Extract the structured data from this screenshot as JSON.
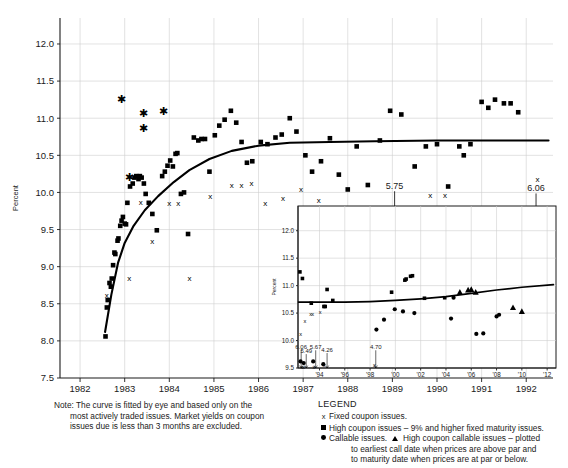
{
  "figure": {
    "note_label": "Note:",
    "note_lines": [
      "The curve is fitted by eye and based only on the",
      "most actively traded issues. Market yields on coupon",
      "issues due is less than 3 months are excluded."
    ],
    "legend_title": "LEGEND",
    "legend_items": [
      {
        "marker": "x",
        "text": "Fixed coupon issues."
      },
      {
        "marker": "square",
        "text": "High coupon issues – 9% and higher fixed maturity issues."
      },
      {
        "marker": "circle",
        "text": "Callable issues.",
        "marker2": "triangle",
        "text2": "High coupon callable issues – plotted"
      },
      {
        "marker": "none",
        "text": "to earliest call date when prices are above par and"
      },
      {
        "marker": "none",
        "text": "to maturity date when prices are at par or below."
      }
    ]
  },
  "chart_data": [
    {
      "id": "main",
      "type": "scatter",
      "title": "",
      "xlabel": "",
      "ylabel": "Percent",
      "xlim": [
        1981.55,
        1992.6
      ],
      "ylim": [
        7.5,
        12.35
      ],
      "yticks": [
        "7.5",
        "8.0",
        "8.5",
        "9.0",
        "9.5",
        "10.0",
        "10.5",
        "11.0",
        "11.5",
        "12.0"
      ],
      "ytick_values": [
        7.5,
        8.0,
        8.5,
        9.0,
        9.5,
        10.0,
        10.5,
        11.0,
        11.5,
        12.0
      ],
      "xticks": [
        "1982",
        "1983",
        "1984",
        "1985",
        "1986",
        "1987",
        "1988",
        "1989",
        "1990",
        "1991",
        "1992"
      ],
      "xtick_values": [
        1982,
        1983,
        1984,
        1985,
        1986,
        1987,
        1988,
        1989,
        1990,
        1991,
        1992
      ],
      "grid": true,
      "legend_position": "below-right",
      "series": [
        {
          "name": "High coupon issues",
          "marker": "square",
          "points": [
            [
              1982.57,
              8.06
            ],
            [
              1982.6,
              8.45
            ],
            [
              1982.62,
              8.55
            ],
            [
              1982.66,
              8.78
            ],
            [
              1982.69,
              8.73
            ],
            [
              1982.71,
              8.84
            ],
            [
              1982.74,
              9.02
            ],
            [
              1982.77,
              9.19
            ],
            [
              1982.79,
              9.17
            ],
            [
              1982.84,
              9.35
            ],
            [
              1982.86,
              9.38
            ],
            [
              1982.9,
              9.55
            ],
            [
              1982.93,
              9.62
            ],
            [
              1982.96,
              9.67
            ],
            [
              1983.0,
              9.58
            ],
            [
              1983.03,
              9.57
            ],
            [
              1983.06,
              9.86
            ],
            [
              1983.12,
              10.08
            ],
            [
              1983.18,
              10.12
            ],
            [
              1983.22,
              10.2
            ],
            [
              1983.26,
              10.22
            ],
            [
              1983.31,
              10.18
            ],
            [
              1983.34,
              10.22
            ],
            [
              1983.38,
              10.2
            ],
            [
              1983.43,
              10.12
            ],
            [
              1983.47,
              9.98
            ],
            [
              1983.54,
              9.86
            ],
            [
              1983.62,
              9.71
            ],
            [
              1983.72,
              9.49
            ],
            [
              1983.84,
              10.22
            ],
            [
              1983.9,
              10.28
            ],
            [
              1983.96,
              10.36
            ],
            [
              1984.02,
              10.43
            ],
            [
              1984.08,
              10.35
            ],
            [
              1984.14,
              10.52
            ],
            [
              1984.18,
              10.53
            ],
            [
              1984.26,
              9.98
            ],
            [
              1984.33,
              10.0
            ],
            [
              1984.42,
              9.44
            ],
            [
              1984.55,
              10.74
            ],
            [
              1984.65,
              10.7
            ],
            [
              1984.72,
              10.72
            ],
            [
              1984.8,
              10.72
            ],
            [
              1984.9,
              10.28
            ],
            [
              1985.02,
              10.77
            ],
            [
              1985.12,
              10.9
            ],
            [
              1985.24,
              10.98
            ],
            [
              1985.38,
              11.1
            ],
            [
              1985.5,
              10.94
            ],
            [
              1985.62,
              10.68
            ],
            [
              1985.74,
              10.4
            ],
            [
              1985.86,
              10.42
            ],
            [
              1986.05,
              10.68
            ],
            [
              1986.2,
              10.65
            ],
            [
              1986.38,
              10.74
            ],
            [
              1986.52,
              10.78
            ],
            [
              1986.7,
              11.0
            ],
            [
              1986.85,
              10.82
            ],
            [
              1987.05,
              10.5
            ],
            [
              1987.2,
              10.28
            ],
            [
              1987.4,
              10.42
            ],
            [
              1987.6,
              10.73
            ],
            [
              1987.8,
              10.24
            ],
            [
              1988.0,
              10.04
            ],
            [
              1988.2,
              10.62
            ],
            [
              1988.45,
              10.1
            ],
            [
              1988.72,
              10.7
            ],
            [
              1988.95,
              11.1
            ],
            [
              1989.2,
              11.05
            ],
            [
              1989.5,
              10.35
            ],
            [
              1989.75,
              10.62
            ],
            [
              1990.0,
              10.65
            ],
            [
              1990.25,
              10.08
            ],
            [
              1990.5,
              10.62
            ],
            [
              1990.6,
              10.5
            ],
            [
              1990.75,
              10.65
            ],
            [
              1991.0,
              11.22
            ],
            [
              1991.15,
              11.14
            ],
            [
              1991.3,
              11.25
            ],
            [
              1991.5,
              11.2
            ],
            [
              1991.65,
              11.2
            ],
            [
              1991.82,
              11.08
            ]
          ]
        },
        {
          "name": "Fixed coupon issues",
          "marker": "x",
          "points": [
            [
              1982.6,
              8.62
            ],
            [
              1983.1,
              8.84
            ],
            [
              1983.36,
              9.87
            ],
            [
              1983.62,
              9.35
            ],
            [
              1984.0,
              9.85
            ],
            [
              1984.2,
              9.85
            ],
            [
              1984.45,
              8.84
            ],
            [
              1984.92,
              9.95
            ],
            [
              1985.4,
              10.1
            ],
            [
              1985.62,
              10.1
            ],
            [
              1985.84,
              10.12
            ],
            [
              1986.15,
              9.86
            ],
            [
              1986.55,
              9.93
            ],
            [
              1986.95,
              10.05
            ],
            [
              1987.35,
              9.9
            ],
            [
              1989.85,
              9.96
            ],
            [
              1990.18,
              9.96
            ],
            [
              1992.25,
              10.18
            ]
          ]
        },
        {
          "name": "Starred outliers",
          "marker": "star",
          "points": [
            [
              1982.93,
              11.26
            ],
            [
              1983.42,
              11.07
            ],
            [
              1983.42,
              10.87
            ],
            [
              1983.88,
              11.1
            ],
            [
              1983.1,
              10.2
            ]
          ]
        }
      ],
      "fit_curve": [
        [
          1982.56,
          8.12
        ],
        [
          1982.7,
          8.62
        ],
        [
          1982.85,
          9.05
        ],
        [
          1983.0,
          9.32
        ],
        [
          1983.2,
          9.55
        ],
        [
          1983.45,
          9.76
        ],
        [
          1983.75,
          9.95
        ],
        [
          1984.1,
          10.14
        ],
        [
          1984.45,
          10.3
        ],
        [
          1984.9,
          10.45
        ],
        [
          1985.4,
          10.56
        ],
        [
          1986.0,
          10.63
        ],
        [
          1986.7,
          10.67
        ],
        [
          1987.6,
          10.68
        ],
        [
          1988.6,
          10.69
        ],
        [
          1990.0,
          10.7
        ],
        [
          1992.5,
          10.7
        ]
      ],
      "annotations": [
        {
          "text": "5.75",
          "x": 1989.05,
          "y": 10.05,
          "arrow_to": 9.74
        },
        {
          "text": "6.06",
          "x": 1992.22,
          "y": 10.02,
          "arrow_to": 9.74
        }
      ]
    },
    {
      "id": "inset",
      "type": "scatter",
      "title": "",
      "xlabel": "",
      "ylabel": "Percent",
      "xlim": [
        1992.3,
        2012.7
      ],
      "ylim": [
        9.5,
        12.45
      ],
      "yticks": [
        "9.5",
        "10.0",
        "10.5",
        "11.0",
        "11.5",
        "12.0"
      ],
      "ytick_values": [
        9.5,
        10.0,
        10.5,
        11.0,
        11.5,
        12.0
      ],
      "xticks": [
        "'94",
        "'96",
        "'98",
        "'00",
        "'02",
        "'04",
        "'06",
        "'08",
        "'10",
        "'12"
      ],
      "xtick_values": [
        1994,
        1996,
        1998,
        2000,
        2002,
        2004,
        2006,
        2008,
        2010,
        2012
      ],
      "grid": true,
      "series": [
        {
          "name": "High coupon issues",
          "marker": "square",
          "points": [
            [
              1992.45,
              11.25
            ],
            [
              1992.65,
              11.13
            ],
            [
              1994.6,
              10.93
            ],
            [
              1995.05,
              10.73
            ],
            [
              1994.35,
              10.62
            ],
            [
              1994.45,
              10.62
            ],
            [
              1993.35,
              10.68
            ],
            [
              1999.7,
              10.88
            ],
            [
              2000.75,
              11.1
            ],
            [
              2000.85,
              11.12
            ],
            [
              2001.2,
              11.17
            ],
            [
              2001.35,
              11.18
            ],
            [
              2002.3,
              10.77
            ],
            [
              2003.9,
              10.78
            ]
          ]
        },
        {
          "name": "Callable issues",
          "marker": "circle",
          "points": [
            [
              1992.5,
              9.62
            ],
            [
              1992.75,
              9.59
            ],
            [
              1993.5,
              9.62
            ],
            [
              1994.3,
              9.57
            ],
            [
              1998.5,
              10.2
            ],
            [
              1999.1,
              10.38
            ],
            [
              1999.95,
              10.57
            ],
            [
              2000.6,
              10.53
            ],
            [
              2001.5,
              10.5
            ],
            [
              2004.4,
              10.4
            ],
            [
              2004.6,
              10.78
            ],
            [
              2006.4,
              10.12
            ],
            [
              2006.95,
              10.13
            ],
            [
              2008.0,
              10.44
            ],
            [
              2008.2,
              10.47
            ]
          ]
        },
        {
          "name": "Fixed coupon issues",
          "marker": "x",
          "points": [
            [
              1992.5,
              10.12
            ],
            [
              1992.85,
              10.35
            ],
            [
              1993.3,
              10.48
            ],
            [
              1993.45,
              10.48
            ],
            [
              1994.05,
              10.52
            ],
            [
              1992.6,
              9.52
            ],
            [
              1992.75,
              9.52
            ],
            [
              1993.55,
              9.52
            ],
            [
              1994.35,
              9.55
            ],
            [
              1998.35,
              9.55
            ]
          ]
        },
        {
          "name": "High coupon callable issues",
          "marker": "triangle",
          "points": [
            [
              2005.1,
              10.88
            ],
            [
              2005.75,
              10.92
            ],
            [
              2006.0,
              10.93
            ],
            [
              2006.35,
              10.88
            ],
            [
              2009.3,
              10.6
            ],
            [
              2010.0,
              10.53
            ]
          ]
        }
      ],
      "fit_curve": [
        [
          1992.35,
          10.7
        ],
        [
          1994.0,
          10.7
        ],
        [
          1996.0,
          10.7
        ],
        [
          1998.0,
          10.71
        ],
        [
          2000.0,
          10.73
        ],
        [
          2002.0,
          10.76
        ],
        [
          2004.0,
          10.8
        ],
        [
          2006.0,
          10.86
        ],
        [
          2008.0,
          10.92
        ],
        [
          2010.0,
          10.97
        ],
        [
          2012.5,
          11.02
        ]
      ],
      "annotations": [
        {
          "text": "6.06",
          "x": 1992.55,
          "y": 9.85,
          "arrow_to": 9.5
        },
        {
          "text": "5.49",
          "x": 1992.95,
          "y": 9.78,
          "arrow_to": 9.5
        },
        {
          "text": "5.67",
          "x": 1993.7,
          "y": 9.85,
          "arrow_to": 9.5
        },
        {
          "text": "4.26",
          "x": 1994.6,
          "y": 9.8,
          "arrow_to": 9.5
        },
        {
          "text": "4.70",
          "x": 1998.45,
          "y": 9.85,
          "arrow_to": 9.5
        }
      ]
    }
  ]
}
